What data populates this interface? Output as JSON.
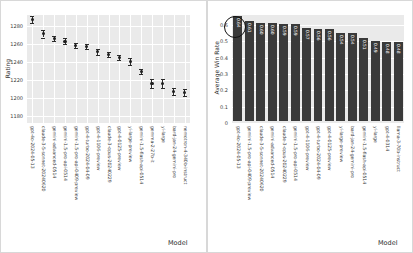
{
  "figure": {
    "background": "#ffffff",
    "panel_bg": "#eaeaea",
    "grid_color": "#ffffff",
    "bar_color": "#3a3a3a",
    "marker_color": "#1f1f1f",
    "annotation_color": "#111111"
  },
  "chart_data": [
    {
      "type": "scatter",
      "title": "",
      "xlabel": "Model",
      "ylabel": "Rating",
      "ylim": [
        1172,
        1292
      ],
      "yticks": [
        "1180",
        "1200",
        "1220",
        "1240",
        "1260",
        "1280"
      ],
      "ytick_values": [
        1180,
        1200,
        1220,
        1240,
        1260,
        1280
      ],
      "grid": true,
      "legend": "none",
      "errorbars": true,
      "categories": [
        "gpt-4o-2024-05-13",
        "claude-3-5-sonnet-20240620",
        "gemini-advanced-0514",
        "gemini-1.5-pro-api-0514",
        "gemini-1.5-pro-api-0409-preview",
        "gpt-4-turbo-2024-04-09",
        "gpt-4-1106-preview",
        "claude-3-opus-20240229",
        "gpt-4-0125-preview",
        "yi-large-preview",
        "gemini-1.5-flash-api-0514",
        "gemma-2-27b-it",
        "yi-large",
        "bard-jan-24-gemini-pro",
        "nemotron-4-340b-instruct"
      ],
      "values": [
        1287,
        1271,
        1266,
        1263,
        1258,
        1257,
        1251,
        1248,
        1245,
        1240,
        1229,
        1216,
        1216,
        1207,
        1206
      ],
      "errors": [
        4,
        4,
        3,
        3,
        3,
        3,
        3,
        3,
        3,
        4,
        3,
        5,
        5,
        4,
        4
      ]
    },
    {
      "type": "bar",
      "title": "",
      "xlabel": "Model",
      "ylabel": "Average Win Rate",
      "ylim": [
        0,
        0.66
      ],
      "yticks": [
        "0",
        "0.1",
        "0.2",
        "0.3",
        "0.4",
        "0.5",
        "0.6"
      ],
      "ytick_values": [
        0,
        0.1,
        0.2,
        0.3,
        0.4,
        0.5,
        0.6
      ],
      "grid": true,
      "legend": "none",
      "annotation": "circle-highlight-first-bar",
      "categories": [
        "gpt-4o-2024-05-13",
        "gemini-1.5-pro-api-0409-preview",
        "claude-3-5-sonnet-20240620",
        "gemini-advanced-0514",
        "claude-3-opus-20240229",
        "gemini-1.5-pro-api-0514",
        "gpt-4-1106-preview",
        "gpt-4-turbo-2024-04-09",
        "gpt-4-0125-preview",
        "yi-large-preview",
        "bard-jan-24-gemini-pro",
        "gemini-1.5-flash-api-0514",
        "yi-large",
        "gpt-4-0314",
        "llama-3-70b-instruct"
      ],
      "values": [
        0.64,
        0.61,
        0.6,
        0.6,
        0.59,
        0.59,
        0.57,
        0.56,
        0.56,
        0.54,
        0.54,
        0.51,
        0.49,
        0.48,
        0.48
      ],
      "value_labels": [
        "0.64",
        "0.61",
        "0.60",
        "0.60",
        "0.59",
        "0.59",
        "0.57",
        "0.56",
        "0.56",
        "0.54",
        "0.54",
        "0.51",
        "0.49",
        "0.48",
        "0.48"
      ]
    }
  ]
}
